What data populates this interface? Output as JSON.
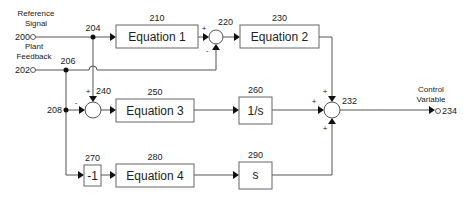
{
  "diagram": {
    "type": "block-diagram",
    "inputs": {
      "reference": {
        "label_line1": "Reference",
        "label_line2": "Signal",
        "ref": "200"
      },
      "feedback": {
        "label_line1": "Plant",
        "label_line2": "Feedback",
        "ref": "202"
      }
    },
    "nodes": {
      "n204": "204",
      "n206": "206",
      "n208": "208"
    },
    "blocks": {
      "b210": {
        "ref": "210",
        "text": "Equation 1"
      },
      "b230": {
        "ref": "230",
        "text": "Equation 2"
      },
      "b250": {
        "ref": "250",
        "text": "Equation 3"
      },
      "b260": {
        "ref": "260",
        "text": "1/s"
      },
      "b270": {
        "ref": "270",
        "text": "-1"
      },
      "b280": {
        "ref": "280",
        "text": "Equation 4"
      },
      "b290": {
        "ref": "290",
        "text": "s"
      }
    },
    "summers": {
      "s220": {
        "ref": "220",
        "sign_top_left": "+",
        "sign_bottom": "-"
      },
      "s240": {
        "ref": "240",
        "sign_top": "+",
        "sign_left": "-"
      },
      "s232": {
        "ref": "232",
        "sign_top": "+",
        "sign_left": "+",
        "sign_bottom": "+"
      }
    },
    "output": {
      "label_line1": "Control",
      "label_line2": "Variable",
      "ref": "234"
    }
  }
}
